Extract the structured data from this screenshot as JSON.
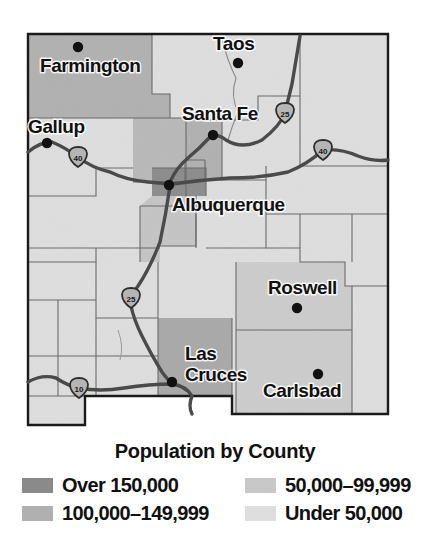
{
  "figure": {
    "type": "choropleth-map",
    "title": "Population by County"
  },
  "legend": {
    "title": "Population by County",
    "items": [
      {
        "id": "over-150000",
        "label": "Over 150,000",
        "color": "#8a8a8a",
        "column": "left"
      },
      {
        "id": "100000-149999",
        "label": "100,000–149,999",
        "color": "#b0b0b0",
        "column": "left"
      },
      {
        "id": "50000-99999",
        "label": "50,000–99,999",
        "color": "#c8c8c8",
        "column": "right"
      },
      {
        "id": "under-50000",
        "label": "Under 50,000",
        "color": "#dedede",
        "column": "right"
      }
    ]
  },
  "map": {
    "frame_color": "#1a1a1a",
    "county_border_color": "#6b6b6b",
    "state_border_color": "#1a1a1a",
    "highway_color": "#4a4a4a",
    "city_dot_color": "#111111",
    "cities": [
      {
        "name": "Farmington",
        "label_x": 40,
        "label_y": 72,
        "dot_x": 78,
        "dot_y": 47
      },
      {
        "name": "Taos",
        "label_x": 213,
        "label_y": 50,
        "dot_x": 238,
        "dot_y": 63
      },
      {
        "name": "Gallup",
        "label_x": 28,
        "label_y": 133,
        "dot_x": 47,
        "dot_y": 143
      },
      {
        "name": "Santa Fe",
        "label_x": 182,
        "label_y": 120,
        "dot_x": 213,
        "dot_y": 135
      },
      {
        "name": "Albuquerque",
        "label_x": 172,
        "label_y": 211,
        "dot_x": 169,
        "dot_y": 185
      },
      {
        "name": "Roswell",
        "label_x": 268,
        "label_y": 294,
        "dot_x": 297,
        "dot_y": 308
      },
      {
        "name": "Las Cruces",
        "label_x": 185,
        "label_y": 360,
        "dot_x": 172,
        "dot_y": 382
      },
      {
        "name": "Carlsbad",
        "label_x": 263,
        "label_y": 397,
        "dot_x": 318,
        "dot_y": 374
      }
    ],
    "city_labels_multiline": {
      "Las Cruces": [
        "Las",
        "Cruces"
      ]
    },
    "highway_shields": [
      {
        "route": "40",
        "x": 78,
        "y": 157
      },
      {
        "route": "25",
        "x": 285,
        "y": 113
      },
      {
        "route": "40",
        "x": 323,
        "y": 150
      },
      {
        "route": "25",
        "x": 131,
        "y": 298
      },
      {
        "route": "10",
        "x": 79,
        "y": 388
      }
    ]
  },
  "chart_data": {
    "type": "heatmap",
    "title": "Population by County",
    "categories": [
      "Over 150,000",
      "100,000–149,999",
      "50,000–99,999",
      "Under 50,000"
    ],
    "values": [
      1,
      3,
      2,
      27
    ],
    "counties": [
      {
        "county": "Bernalillo",
        "city": "Albuquerque",
        "class": "over-150000"
      },
      {
        "county": "San Juan",
        "city": "Farmington",
        "class": "100000-149999"
      },
      {
        "county": "Santa Fe",
        "city": "Santa Fe",
        "class": "100000-149999"
      },
      {
        "county": "Doña Ana",
        "city": "Las Cruces",
        "class": "100000-149999"
      },
      {
        "county": "Chaves",
        "city": "Roswell",
        "class": "50000-99999"
      },
      {
        "county": "Eddy",
        "city": "Carlsbad",
        "class": "50000-99999"
      },
      {
        "county": "Taos",
        "city": "Taos",
        "class": "under-50000"
      },
      {
        "county": "McKinley",
        "city": "Gallup",
        "class": "under-50000"
      }
    ],
    "xlabel": "",
    "ylabel": "",
    "legend_position": "bottom"
  }
}
